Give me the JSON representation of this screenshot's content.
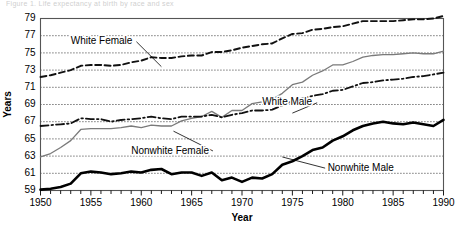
{
  "figure": {
    "caption_fragment": "Figure 1.  Life expectancy at birth by race and sex"
  },
  "chart_data": {
    "type": "line",
    "title": "",
    "xlabel": "Year",
    "ylabel": "Years",
    "xlim": [
      1950,
      1990
    ],
    "ylim": [
      59,
      79
    ],
    "ytick_step": 2,
    "xtick_label_step": 5,
    "xtick_minor_step": 1,
    "grid": "horizontal-dotted",
    "legend": "inline-annotations",
    "yticks": [
      59,
      61,
      63,
      65,
      67,
      69,
      71,
      73,
      75,
      77,
      79
    ],
    "xticks": [
      1950,
      1955,
      1960,
      1965,
      1970,
      1975,
      1980,
      1985,
      1990
    ],
    "x": [
      1950,
      1951,
      1952,
      1953,
      1954,
      1955,
      1956,
      1957,
      1958,
      1959,
      1960,
      1961,
      1962,
      1963,
      1964,
      1965,
      1966,
      1967,
      1968,
      1969,
      1970,
      1971,
      1972,
      1973,
      1974,
      1975,
      1976,
      1977,
      1978,
      1979,
      1980,
      1981,
      1982,
      1983,
      1984,
      1985,
      1986,
      1987,
      1988,
      1989,
      1990
    ],
    "series": [
      {
        "name": "White Female",
        "style": "dashed",
        "color": "#111111",
        "width": 1.9,
        "label_x": 1953.0,
        "label_y": 76.3,
        "leader_to_x": 1962.0,
        "leader_to_y": 73.4,
        "values": [
          72.2,
          72.4,
          72.7,
          73.0,
          73.5,
          73.6,
          73.6,
          73.5,
          73.6,
          73.9,
          74.1,
          74.5,
          74.4,
          74.4,
          74.6,
          74.7,
          74.7,
          75.1,
          75.1,
          75.3,
          75.6,
          75.8,
          76.0,
          76.1,
          76.7,
          77.2,
          77.3,
          77.7,
          77.8,
          78.0,
          78.1,
          78.4,
          78.7,
          78.7,
          78.7,
          78.7,
          78.8,
          78.9,
          78.9,
          79.0,
          79.3
        ]
      },
      {
        "name": "Nonwhite Female",
        "style": "solid-thin",
        "color": "#7a7a7a",
        "width": 1.3,
        "label_x": 1959.0,
        "label_y": 63.6,
        "leader_to_x": 1963.2,
        "leader_to_y": 65.9,
        "values": [
          62.9,
          63.3,
          64.0,
          64.8,
          66.1,
          66.2,
          66.2,
          66.2,
          66.3,
          66.5,
          66.3,
          66.6,
          66.5,
          66.5,
          67.1,
          67.4,
          67.6,
          68.2,
          67.5,
          68.3,
          68.3,
          69.1,
          69.3,
          69.6,
          70.3,
          71.3,
          71.6,
          72.4,
          72.9,
          73.6,
          73.6,
          74.0,
          74.5,
          74.7,
          74.8,
          74.8,
          74.9,
          75.0,
          74.9,
          74.9,
          75.2
        ]
      },
      {
        "name": "White Male",
        "style": "dash-dot",
        "color": "#111111",
        "width": 1.8,
        "label_x": 1972.0,
        "label_y": 69.2,
        "leader_to_x": 1975.0,
        "leader_to_y": 68.0,
        "values": [
          66.5,
          66.6,
          66.7,
          66.8,
          67.4,
          67.3,
          67.3,
          67.0,
          67.2,
          67.3,
          67.4,
          67.6,
          67.4,
          67.3,
          67.6,
          67.6,
          67.6,
          67.8,
          67.5,
          67.8,
          68.0,
          68.3,
          68.3,
          68.4,
          68.9,
          69.4,
          69.7,
          70.0,
          70.2,
          70.6,
          70.7,
          71.1,
          71.5,
          71.6,
          71.8,
          71.9,
          72.0,
          72.2,
          72.3,
          72.5,
          72.7
        ]
      },
      {
        "name": "Nonwhite Male",
        "style": "solid-thick",
        "color": "#000000",
        "width": 2.6,
        "label_x": 1978.5,
        "label_y": 61.6,
        "leader_to_x": 1974.0,
        "leader_to_y": 62.9,
        "values": [
          59.1,
          59.2,
          59.4,
          59.8,
          61.0,
          61.2,
          61.1,
          60.9,
          61.0,
          61.2,
          61.1,
          61.4,
          61.5,
          60.9,
          61.1,
          61.1,
          60.7,
          61.1,
          60.2,
          60.5,
          60.0,
          60.5,
          60.4,
          60.9,
          62.0,
          62.4,
          63.0,
          63.7,
          64.0,
          64.8,
          65.3,
          66.0,
          66.5,
          66.8,
          67.0,
          66.8,
          66.7,
          66.9,
          66.7,
          66.5,
          67.2
        ]
      }
    ]
  }
}
